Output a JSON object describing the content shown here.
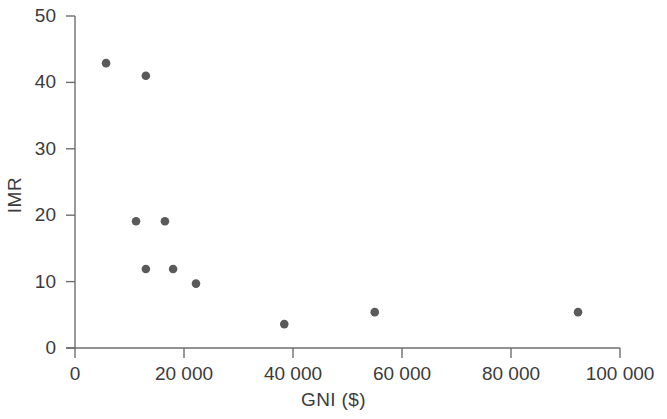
{
  "chart_data": {
    "type": "scatter",
    "title": "",
    "xlabel": "GNI ($)",
    "ylabel": "IMR",
    "xlim": [
      0,
      100000
    ],
    "ylim": [
      0,
      50
    ],
    "xticks": [
      0,
      20000,
      40000,
      60000,
      80000,
      100000
    ],
    "xtick_labels": [
      "0",
      "20 000",
      "40 000",
      "60 000",
      "80 000",
      "100 000"
    ],
    "yticks": [
      0,
      10,
      20,
      30,
      40,
      50
    ],
    "ytick_labels": [
      "0",
      "10",
      "20",
      "30",
      "40",
      "50"
    ],
    "grid": false,
    "legend": null,
    "marker_color": "#5a5a5a",
    "axis_color": "#6e6e6e",
    "points": [
      {
        "x": 5700,
        "y": 42.9
      },
      {
        "x": 13000,
        "y": 41.0
      },
      {
        "x": 11200,
        "y": 19.1
      },
      {
        "x": 16500,
        "y": 19.1
      },
      {
        "x": 13000,
        "y": 11.9
      },
      {
        "x": 18000,
        "y": 11.9
      },
      {
        "x": 22200,
        "y": 9.7
      },
      {
        "x": 38400,
        "y": 3.6
      },
      {
        "x": 55000,
        "y": 5.4
      },
      {
        "x": 92300,
        "y": 5.4
      }
    ]
  }
}
